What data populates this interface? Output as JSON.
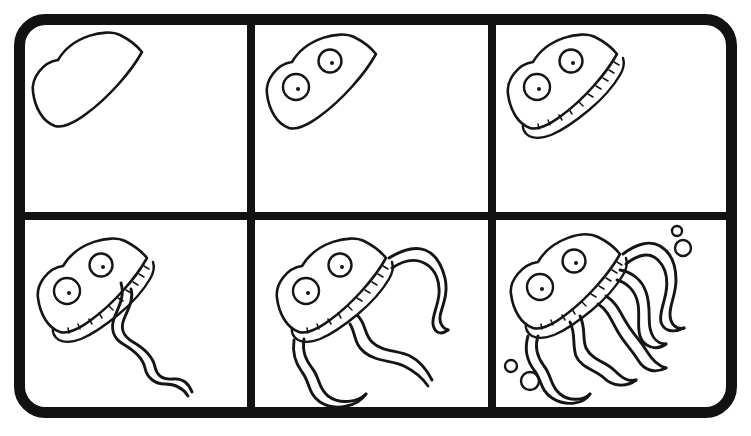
{
  "artwork": {
    "title": "How to Draw a Jellyfish",
    "subject": "jellyfish",
    "style": "black-and-white line art drawing tutorial",
    "medium": "ink outline on white background",
    "panel_count": 6,
    "grid": {
      "rows": 2,
      "columns": 3
    },
    "colors": {
      "background": "#ffffff",
      "ink": "#151515",
      "frame": "#121212"
    },
    "frame": {
      "shape": "rounded-rectangle",
      "corner_radius": 26,
      "stroke_width": 11,
      "x": 14,
      "y": 14,
      "width": 723,
      "height": 404
    },
    "dividers": {
      "horizontal_y": [
        216
      ],
      "vertical_x": [
        251,
        492
      ]
    }
  },
  "panels": [
    {
      "index": 1,
      "name": "panel-step-1",
      "step_label": "Step 1",
      "description": "Draw the teardrop-shaped bell outline",
      "elements": [
        "bell-outline"
      ],
      "eye_count": 0,
      "tentacle_count": 0,
      "bubble_count": 0,
      "has_frill": false
    },
    {
      "index": 2,
      "name": "panel-step-2",
      "step_label": "Step 2",
      "description": "Add two round eyes with dot pupils",
      "elements": [
        "bell-outline",
        "eye-left",
        "eye-right"
      ],
      "eye_count": 2,
      "tentacle_count": 0,
      "bubble_count": 0,
      "has_frill": false
    },
    {
      "index": 3,
      "name": "panel-step-3",
      "step_label": "Step 3",
      "description": "Add the frilled ruffle band along the bell rim",
      "elements": [
        "bell-outline",
        "eye-left",
        "eye-right",
        "frill-band"
      ],
      "eye_count": 2,
      "tentacle_count": 0,
      "bubble_count": 0,
      "has_frill": true
    },
    {
      "index": 4,
      "name": "panel-step-4",
      "step_label": "Step 4",
      "description": "Add one long wavy ribbon tentacle trailing down-right",
      "elements": [
        "bell-outline",
        "eye-left",
        "eye-right",
        "frill-band",
        "tentacle-1"
      ],
      "eye_count": 2,
      "tentacle_count": 1,
      "bubble_count": 0,
      "has_frill": true
    },
    {
      "index": 5,
      "name": "panel-step-5",
      "step_label": "Step 5",
      "description": "Add two more wavy ribbon tentacles",
      "elements": [
        "bell-outline",
        "eye-left",
        "eye-right",
        "frill-band",
        "tentacle-1",
        "tentacle-2",
        "tentacle-3"
      ],
      "eye_count": 2,
      "tentacle_count": 3,
      "bubble_count": 0,
      "has_frill": true
    },
    {
      "index": 6,
      "name": "panel-step-6",
      "step_label": "Step 6",
      "description": "Finish with extra tentacles and water bubbles",
      "elements": [
        "bell-outline",
        "eye-left",
        "eye-right",
        "frill-band",
        "tentacle-1",
        "tentacle-2",
        "tentacle-3",
        "tentacle-4",
        "tentacle-5",
        "bubbles"
      ],
      "eye_count": 2,
      "tentacle_count": 5,
      "bubble_count": 4,
      "has_frill": true
    }
  ]
}
